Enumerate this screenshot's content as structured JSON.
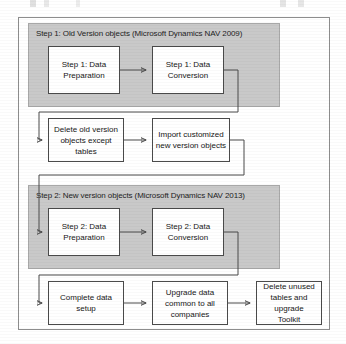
{
  "figure": {
    "type": "flowchart",
    "orientation": "top-to-bottom, serpentine rows",
    "panels": [
      {
        "id": "step1",
        "label": "Step 1: Old Version objects (Microsoft Dynamics NAV 2009)",
        "fill": "#c9c9c9"
      },
      {
        "id": "step2",
        "label": "Step 2: New version objects (Microsoft Dynamics NAV 2013)",
        "label_clipped": "Step 2: New version objects (Microsoft Dynamics NAV 2013",
        "fill": "#c9c9c9"
      }
    ],
    "nodes": [
      {
        "id": "n1",
        "line1": "Step 1: Data",
        "line2": "Preparation"
      },
      {
        "id": "n2",
        "line1": "Step 1: Data",
        "line2": "Conversion"
      },
      {
        "id": "n3",
        "line1": "Delete old version",
        "line2": "objects except",
        "line3": "tables"
      },
      {
        "id": "n4",
        "line1": "Import customized",
        "line2": "new version objects"
      },
      {
        "id": "n5",
        "line1": "Step 2: Data",
        "line2": "Preparation"
      },
      {
        "id": "n6",
        "line1": "Step 2: Data",
        "line2": "Conversion"
      },
      {
        "id": "n7",
        "line1": "Complete data",
        "line2": "setup"
      },
      {
        "id": "n8",
        "line1": "Upgrade data",
        "line2": "common to all",
        "line3": "companies"
      },
      {
        "id": "n9",
        "line1": "Delete unused",
        "line2": "tables and upgrade",
        "line3": "Toolkit"
      }
    ],
    "edges": [
      {
        "from": "n1",
        "to": "n2",
        "style": "straight-right"
      },
      {
        "from": "n2",
        "to": "n3",
        "style": "u-turn-down-left"
      },
      {
        "from": "n3",
        "to": "n4",
        "style": "straight-right"
      },
      {
        "from": "n4",
        "to": "n5",
        "style": "u-turn-down-left"
      },
      {
        "from": "n5",
        "to": "n6",
        "style": "straight-right"
      },
      {
        "from": "n6",
        "to": "n7",
        "style": "u-turn-down-left"
      },
      {
        "from": "n7",
        "to": "n8",
        "style": "straight-right"
      },
      {
        "from": "n8",
        "to": "n9",
        "style": "straight-right"
      }
    ],
    "colors": {
      "panel_fill": "#c9c9c9",
      "node_fill": "#ffffff",
      "stroke": "#4a4a4a",
      "frame_stroke": "#8d8d8d",
      "text": "#161616"
    }
  }
}
